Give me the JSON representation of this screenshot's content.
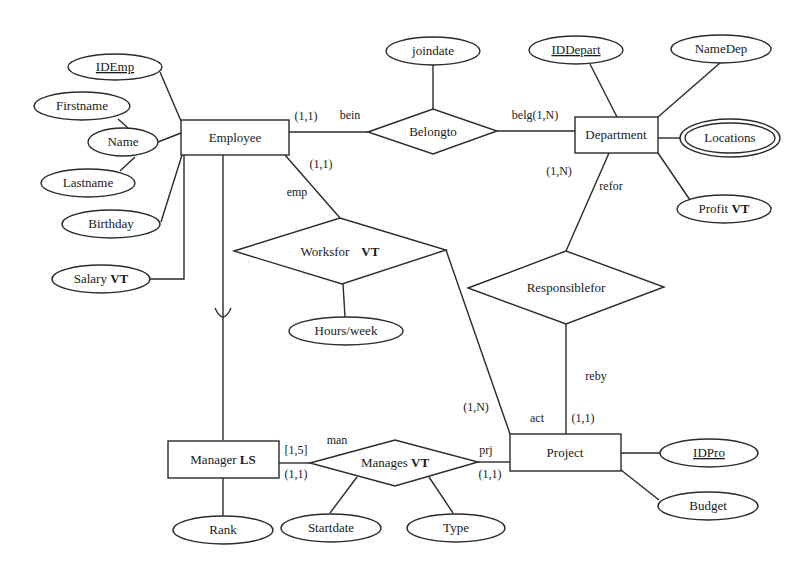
{
  "diagram": {
    "type": "ER diagram",
    "entities": [
      {
        "id": "employee",
        "label": "Employee"
      },
      {
        "id": "department",
        "label": "Department"
      },
      {
        "id": "project",
        "label": "Project"
      },
      {
        "id": "manager",
        "label": "Manager",
        "suffix": "LS"
      }
    ],
    "relationships": [
      {
        "id": "belongto",
        "label": "Belongto"
      },
      {
        "id": "worksfor",
        "label": "Worksfor",
        "suffix": "VT"
      },
      {
        "id": "responsiblefor",
        "label": "Responsiblefor"
      },
      {
        "id": "manages",
        "label": "Manages",
        "suffix": "VT"
      }
    ],
    "attributes": {
      "idemp": "IDEmp",
      "firstname": "Firstname",
      "name": "Name",
      "lastname": "Lastname",
      "birthday": "Birthday",
      "salary": "Salary",
      "salary_suffix": "VT",
      "joindate": "joindate",
      "iddepart": "IDDepart",
      "namedep": "NameDep",
      "locations": "Locations",
      "profit": "Profit",
      "profit_suffix": "VT",
      "hours": "Hours/week",
      "idpro": "IDPro",
      "budget": "Budget",
      "rank": "Rank",
      "startdate": "Startdate",
      "type": "Type"
    },
    "roles": {
      "bein": "bein",
      "belg": "belg(1,N)",
      "emp": "emp",
      "refor": "refor",
      "reby": "reby",
      "act": "act",
      "man": "man",
      "prj": "prj"
    },
    "cardinalities": {
      "emp_belongto": "(1,1)",
      "emp_worksfor": "(1,1)",
      "dept_responsible": "(1,N)",
      "proj_worksfor": "(1,N)",
      "proj_responsible": "(1,1)",
      "manager_time": "[1,5]",
      "manager_manages": "(1,1)",
      "project_manages": "(1,1)"
    }
  }
}
